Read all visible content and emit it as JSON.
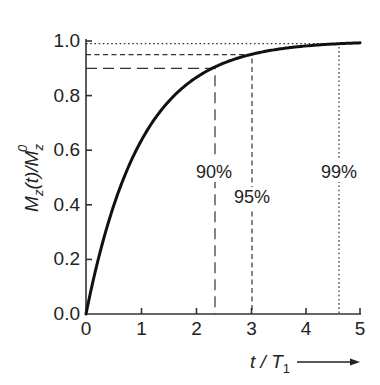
{
  "chart_data": {
    "type": "line",
    "title": "",
    "xlabel": "t / T1",
    "ylabel": "Mz(t)/Mz0",
    "xlim": [
      0,
      5
    ],
    "ylim": [
      0,
      1.0
    ],
    "grid": false,
    "x_ticks": [
      0,
      1,
      2,
      3,
      4,
      5
    ],
    "y_ticks": [
      0.0,
      0.2,
      0.4,
      0.6,
      0.8,
      1.0
    ],
    "x_tick_labels": [
      "0",
      "1",
      "2",
      "3",
      "4",
      "5"
    ],
    "y_tick_labels": [
      "0.0",
      "0.2",
      "0.4",
      "0.6",
      "0.8",
      "1.0"
    ],
    "series": [
      {
        "name": "Mz(t)/Mz0 = 1 - exp(-t/T1)",
        "x": [
          0,
          0.25,
          0.5,
          0.75,
          1.0,
          1.5,
          2.0,
          2.3,
          2.5,
          3.0,
          3.5,
          4.0,
          4.6,
          5.0
        ],
        "values": [
          0.0,
          0.221,
          0.393,
          0.528,
          0.632,
          0.777,
          0.865,
          0.9,
          0.918,
          0.95,
          0.97,
          0.982,
          0.99,
          0.993
        ]
      }
    ],
    "annotations": [
      {
        "label": "90%",
        "x": 2.3,
        "y": 0.9,
        "style": "long-dash"
      },
      {
        "label": "95%",
        "x": 3.0,
        "y": 0.95,
        "style": "short-dash"
      },
      {
        "label": "99%",
        "x": 4.6,
        "y": 0.99,
        "style": "dotted"
      }
    ],
    "x_axis_arrow": true
  },
  "labels": {
    "y_axis_main": "M",
    "y_axis_sub": "z",
    "y_axis_mid": "(t)/M",
    "y_axis_sub2": "z",
    "y_axis_sup": "0",
    "x_axis_t": "t",
    "x_axis_slash": " / ",
    "x_axis_T": "T",
    "x_axis_sub": "1",
    "ann_90": "90%",
    "ann_95": "95%",
    "ann_99": "99%",
    "x0": "0",
    "x1": "1",
    "x2": "2",
    "x3": "3",
    "x4": "4",
    "x5": "5",
    "y0": "0.0",
    "y1": "0.2",
    "y2": "0.4",
    "y3": "0.6",
    "y4": "0.8",
    "y5": "1.0"
  }
}
